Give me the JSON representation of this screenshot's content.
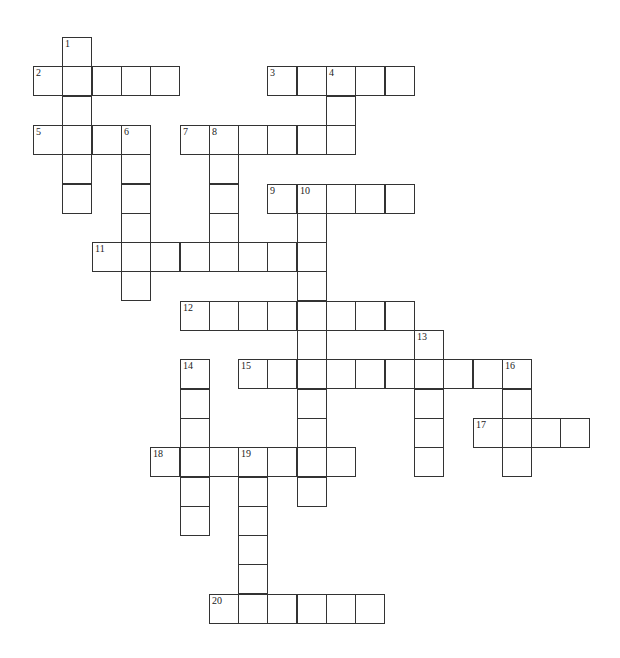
{
  "puzzle": {
    "type": "crossword",
    "grid": {
      "origin_x": 33,
      "origin_y": 37,
      "cell_size": 29.3
    },
    "entries": [
      {
        "number": "1",
        "direction": "down",
        "row": 0,
        "col": 1,
        "length": 6
      },
      {
        "number": "2",
        "direction": "across",
        "row": 1,
        "col": 0,
        "length": 5
      },
      {
        "number": "3",
        "direction": "across",
        "row": 1,
        "col": 8,
        "length": 5
      },
      {
        "number": "4",
        "direction": "down",
        "row": 1,
        "col": 10,
        "length": 3
      },
      {
        "number": "5",
        "direction": "across",
        "row": 3,
        "col": 0,
        "length": 4
      },
      {
        "number": "6",
        "direction": "down",
        "row": 3,
        "col": 3,
        "length": 6
      },
      {
        "number": "7",
        "direction": "across",
        "row": 3,
        "col": 5,
        "length": 6
      },
      {
        "number": "8",
        "direction": "down",
        "row": 3,
        "col": 6,
        "length": 5
      },
      {
        "number": "9",
        "direction": "across",
        "row": 5,
        "col": 8,
        "length": 5
      },
      {
        "number": "10",
        "direction": "down",
        "row": 5,
        "col": 9,
        "length": 11
      },
      {
        "number": "11",
        "direction": "across",
        "row": 7,
        "col": 2,
        "length": 8
      },
      {
        "number": "12",
        "direction": "across",
        "row": 9,
        "col": 5,
        "length": 8
      },
      {
        "number": "13",
        "direction": "down",
        "row": 10,
        "col": 13,
        "length": 5
      },
      {
        "number": "14",
        "direction": "down",
        "row": 11,
        "col": 5,
        "length": 6
      },
      {
        "number": "15",
        "direction": "across",
        "row": 11,
        "col": 7,
        "length": 10
      },
      {
        "number": "16",
        "direction": "down",
        "row": 11,
        "col": 16,
        "length": 4
      },
      {
        "number": "17",
        "direction": "across",
        "row": 13,
        "col": 15,
        "length": 4
      },
      {
        "number": "18",
        "direction": "across",
        "row": 14,
        "col": 4,
        "length": 7
      },
      {
        "number": "19",
        "direction": "down",
        "row": 14,
        "col": 7,
        "length": 6
      },
      {
        "number": "20",
        "direction": "across",
        "row": 19,
        "col": 6,
        "length": 6
      }
    ]
  }
}
